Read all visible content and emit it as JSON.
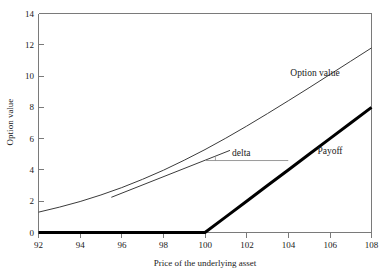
{
  "chart_data": {
    "type": "line",
    "title": "",
    "subtitle": "",
    "xlabel": "Price of the underlying asset",
    "ylabel": "Option value",
    "xlim": [
      92,
      108
    ],
    "ylim": [
      0,
      14
    ],
    "xticks": [
      92,
      94,
      96,
      98,
      100,
      102,
      104,
      106,
      108
    ],
    "yticks": [
      0,
      2,
      4,
      6,
      8,
      10,
      12,
      14
    ],
    "xtick_labels": [
      "92",
      "94",
      "96",
      "98",
      "100",
      "102",
      "104",
      "106",
      "108"
    ],
    "ytick_labels": [
      "0",
      "2",
      "4",
      "6",
      "8",
      "10",
      "12",
      "14"
    ],
    "grid": false,
    "legend": "inline-annotations",
    "x": [
      92,
      93,
      94,
      95,
      96,
      97,
      98,
      99,
      100,
      101,
      102,
      103,
      104,
      105,
      106,
      107,
      108
    ],
    "series": [
      {
        "name": "Option value",
        "style": "thin",
        "values": [
          1.3,
          1.62,
          1.98,
          2.4,
          2.87,
          3.4,
          3.98,
          4.62,
          5.3,
          6.03,
          6.8,
          7.6,
          8.42,
          9.25,
          10.1,
          10.95,
          11.8
        ]
      },
      {
        "name": "Payoff",
        "style": "thick",
        "values": [
          0,
          0,
          0,
          0,
          0,
          0,
          0,
          0,
          0,
          1,
          2,
          3,
          4,
          5,
          6,
          7,
          8
        ]
      }
    ],
    "annotations": [
      {
        "name": "delta",
        "label": "delta",
        "kind": "tangent-angle",
        "tangent_point_x": 100,
        "tangent_point_y": 4.6,
        "tangent_from_x": 95.5,
        "tangent_from_y": 2.25,
        "tangent_to_x": 101.2,
        "tangent_to_y": 5.25,
        "horizontal_from_x": 100,
        "horizontal_to_x": 104,
        "horizontal_y": 4.6,
        "label_x": 101.3,
        "label_y": 5.1
      },
      {
        "name": "option-value-label",
        "label": "Option value",
        "x": 104.1,
        "y": 10.2
      },
      {
        "name": "payoff-label",
        "label": "Payoff",
        "x": 105.4,
        "y": 5.2
      }
    ],
    "colors": {
      "option_value_curve": "#3b3b3b",
      "payoff_curve": "#000000",
      "frame": "#7a7a7a",
      "delta_horizontal": "#9a9a9a",
      "background": "#ffffff",
      "text": "#1a1a1a"
    }
  }
}
